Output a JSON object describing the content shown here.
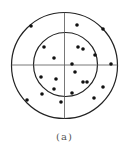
{
  "figure": {
    "caption": "(a)",
    "stroke_color": "#222222",
    "dot_color": "#111111",
    "outer_circle": {
      "cx": 64.5,
      "cy": 65.5,
      "r": 53
    },
    "inner_circle": {
      "cx": 65.5,
      "cy": 64.5,
      "r": 32
    },
    "crosshair": {
      "cx": 64.5,
      "cy": 65
    },
    "dots": [
      [
        31,
        26
      ],
      [
        77,
        25
      ],
      [
        103,
        29
      ],
      [
        44,
        47
      ],
      [
        78,
        47
      ],
      [
        83,
        49
      ],
      [
        95,
        55
      ],
      [
        54,
        58
      ],
      [
        72,
        64
      ],
      [
        111,
        64
      ],
      [
        75,
        72
      ],
      [
        41,
        77
      ],
      [
        56,
        79
      ],
      [
        83,
        82
      ],
      [
        87,
        82
      ],
      [
        103,
        87
      ],
      [
        54,
        89
      ],
      [
        42,
        94
      ],
      [
        72,
        93
      ],
      [
        94,
        98
      ],
      [
        27,
        100
      ],
      [
        61,
        102
      ]
    ],
    "dot_radius": 1.8
  }
}
